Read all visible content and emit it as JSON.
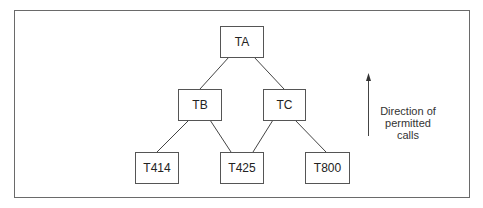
{
  "diagram": {
    "nodes": [
      {
        "id": "TA",
        "label": "TA"
      },
      {
        "id": "TB",
        "label": "TB"
      },
      {
        "id": "TC",
        "label": "TC"
      },
      {
        "id": "T414",
        "label": "T414"
      },
      {
        "id": "T425",
        "label": "T425"
      },
      {
        "id": "T800",
        "label": "T800"
      }
    ],
    "edges": [
      {
        "from": "TA",
        "to": "TB"
      },
      {
        "from": "TA",
        "to": "TC"
      },
      {
        "from": "TB",
        "to": "T414"
      },
      {
        "from": "TB",
        "to": "T425"
      },
      {
        "from": "TC",
        "to": "T425"
      },
      {
        "from": "TC",
        "to": "T800"
      }
    ],
    "legend": {
      "arrow": "arrow-up",
      "line1": "Direction of",
      "line2": "permitted",
      "line3": "calls"
    }
  }
}
